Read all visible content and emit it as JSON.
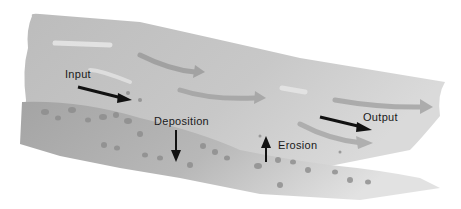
{
  "diagram": {
    "labels": {
      "input": "Input",
      "deposition": "Deposition",
      "erosion": "Erosion",
      "output": "Output"
    },
    "colors": {
      "background": "#ffffff",
      "water": "#bdbdbd",
      "water_light": "#d6d6d6",
      "bed": "#a9a9a9",
      "flow_arrow": "#9a9a9a",
      "flow_highlight": "#e6e6e6",
      "process_arrow": "#111111",
      "pebble": "#8c8c8c",
      "label_text": "#1a1a1a"
    }
  }
}
